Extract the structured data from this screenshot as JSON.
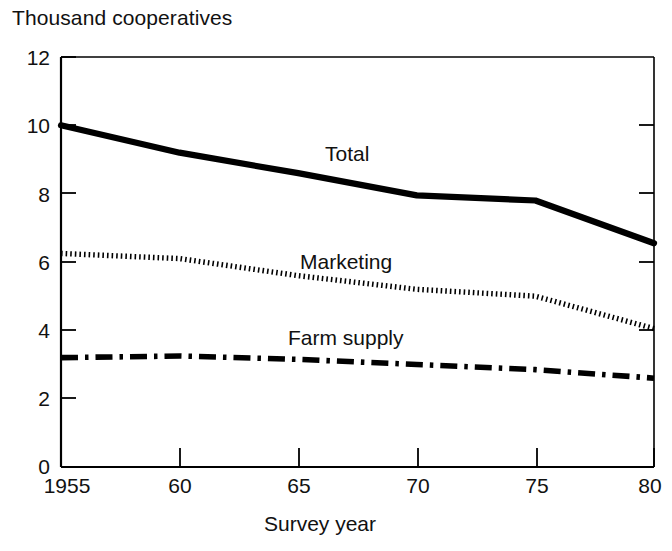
{
  "chart_data": {
    "type": "line",
    "title": "",
    "ylabel": "Thousand cooperatives",
    "xlabel": "Survey year",
    "x": [
      1955,
      1960,
      1965,
      1970,
      1975,
      1980
    ],
    "xtick_labels": [
      "1955",
      "60",
      "65",
      "70",
      "75",
      "80"
    ],
    "ytick_labels": [
      "0",
      "2",
      "4",
      "6",
      "8",
      "10",
      "12"
    ],
    "yticks": [
      0,
      2,
      4,
      6,
      8,
      10,
      12
    ],
    "xlim": [
      1955,
      1980
    ],
    "ylim": [
      0,
      12
    ],
    "grid": false,
    "legend_position": "inline-annotations",
    "series": [
      {
        "name": "Total",
        "style": "solid-thick",
        "values": [
          10.0,
          9.2,
          8.6,
          7.95,
          7.8,
          6.55
        ]
      },
      {
        "name": "Marketing",
        "style": "fine-dotted",
        "values": [
          6.25,
          6.1,
          5.6,
          5.2,
          5.0,
          4.05
        ]
      },
      {
        "name": "Farm supply",
        "style": "dash-dot",
        "values": [
          3.2,
          3.25,
          3.15,
          3.0,
          2.85,
          2.6
        ]
      }
    ],
    "annotations": [
      {
        "text": "Total",
        "x_frac": 0.455,
        "y_value": 9.1
      },
      {
        "text": "Marketing",
        "x_frac": 0.405,
        "y_value": 6.05
      },
      {
        "text": "Farm supply",
        "x_frac": 0.39,
        "y_value": 3.85
      }
    ]
  },
  "axes": {
    "y_axis_caption": "Thousand cooperatives",
    "x_axis_caption": "Survey year",
    "ytick_0": "0",
    "ytick_2": "2",
    "ytick_4": "4",
    "ytick_6": "6",
    "ytick_8": "8",
    "ytick_10": "10",
    "ytick_12": "12",
    "xtick_1955": "1955",
    "xtick_60": "60",
    "xtick_65": "65",
    "xtick_70": "70",
    "xtick_75": "75",
    "xtick_80": "80"
  },
  "series_labels": {
    "total": "Total",
    "marketing": "Marketing",
    "farm_supply": "Farm supply"
  },
  "colors": {
    "ink": "#000000",
    "background": "#ffffff"
  }
}
